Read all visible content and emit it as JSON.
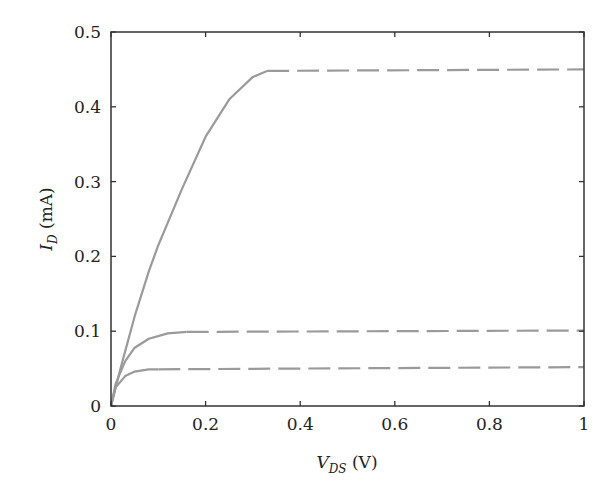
{
  "chart_data": {
    "type": "line",
    "title": "",
    "xlabel": "V_DS (V)",
    "ylabel": "I_D (mA)",
    "xlabel_parts": {
      "main": "V",
      "sub": "DS",
      "unit": " (V)"
    },
    "ylabel_parts": {
      "main": "I",
      "sub": "D",
      "unit": " (mA)"
    },
    "xlim": [
      0,
      1
    ],
    "ylim": [
      0,
      0.5
    ],
    "x_ticks": [
      "0",
      "0.2",
      "0.4",
      "0.6",
      "0.8",
      "1"
    ],
    "y_ticks": [
      "0",
      "0.1",
      "0.2",
      "0.3",
      "0.4",
      "0.5"
    ],
    "grid": false,
    "legend": null,
    "line_color": "#9a9a9a",
    "series": [
      {
        "name": "curve-high",
        "saturation_current": 0.45,
        "saturation_voltage": 0.33,
        "solid_x": [
          0,
          0.02,
          0.05,
          0.08,
          0.1,
          0.15,
          0.2,
          0.25,
          0.3,
          0.33
        ],
        "solid_y": [
          0,
          0.05,
          0.12,
          0.18,
          0.215,
          0.29,
          0.36,
          0.41,
          0.44,
          0.448
        ],
        "dashed_x": [
          0.33,
          1.0
        ],
        "dashed_y": [
          0.448,
          0.45
        ]
      },
      {
        "name": "curve-mid",
        "saturation_current": 0.1,
        "saturation_voltage": 0.16,
        "solid_x": [
          0,
          0.01,
          0.03,
          0.05,
          0.08,
          0.12,
          0.16
        ],
        "solid_y": [
          0,
          0.03,
          0.06,
          0.078,
          0.09,
          0.097,
          0.099
        ],
        "dashed_x": [
          0.16,
          1.0
        ],
        "dashed_y": [
          0.099,
          0.101
        ]
      },
      {
        "name": "curve-low",
        "saturation_current": 0.05,
        "saturation_voltage": 0.1,
        "solid_x": [
          0,
          0.01,
          0.03,
          0.05,
          0.08,
          0.1
        ],
        "solid_y": [
          0,
          0.025,
          0.04,
          0.046,
          0.049,
          0.049
        ],
        "dashed_x": [
          0.1,
          1.0
        ],
        "dashed_y": [
          0.049,
          0.052
        ]
      }
    ]
  }
}
